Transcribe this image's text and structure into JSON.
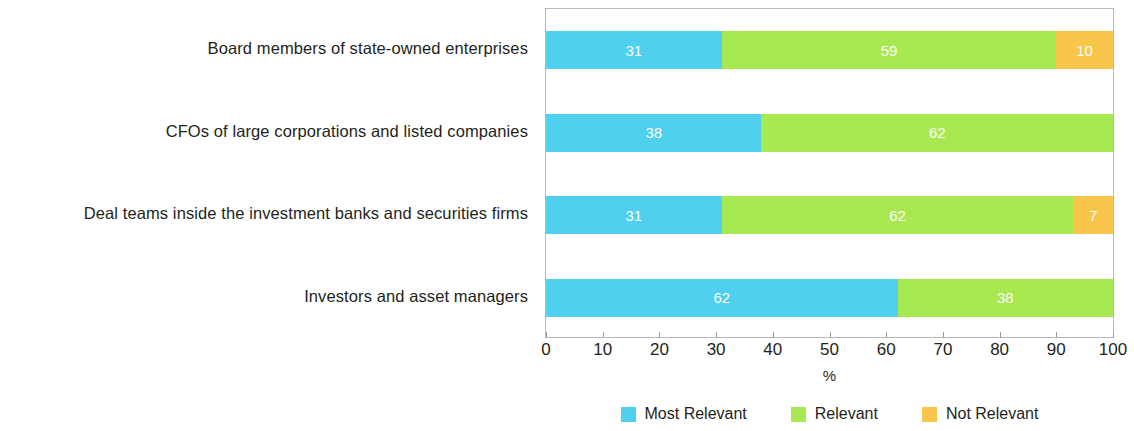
{
  "chart_data": {
    "type": "bar",
    "orientation": "horizontal",
    "stacked": true,
    "stack_mode": "percent",
    "title": "",
    "subtitle": "",
    "xlabel": "%",
    "ylabel": "",
    "xlim": [
      0,
      100
    ],
    "xticks": [
      0,
      10,
      20,
      30,
      40,
      50,
      60,
      70,
      80,
      90,
      100
    ],
    "xtick_labels": [
      "0",
      "10",
      "20",
      "30",
      "40",
      "50",
      "60",
      "70",
      "80",
      "90",
      "100"
    ],
    "grid": false,
    "legend_position": "bottom-center",
    "categories": [
      "Board members of state-owned enterprises",
      "CFOs of large corporations and listed companies",
      "Deal teams inside the investment banks and securities firms",
      "Investors and asset managers"
    ],
    "series": [
      {
        "name": "Most Relevant",
        "color": "#4FD0EE",
        "values": [
          31,
          38,
          31,
          62
        ]
      },
      {
        "name": "Relevant",
        "color": "#A8E851",
        "values": [
          59,
          62,
          62,
          38
        ]
      },
      {
        "name": "Not Relevant",
        "color": "#F8C64A",
        "values": [
          10,
          0,
          7,
          0
        ]
      }
    ],
    "bar_labels": [
      [
        "31",
        "59",
        "10"
      ],
      [
        "38",
        "62",
        ""
      ],
      [
        "31",
        "62",
        "7"
      ],
      [
        "62",
        "38",
        ""
      ]
    ]
  },
  "axis": {
    "x_title": "%",
    "tick_labels": [
      "0",
      "10",
      "20",
      "30",
      "40",
      "50",
      "60",
      "70",
      "80",
      "90",
      "100"
    ]
  },
  "legend": {
    "items": [
      {
        "label": "Most Relevant",
        "color": "#4FD0EE"
      },
      {
        "label": "Relevant",
        "color": "#A8E851"
      },
      {
        "label": "Not Relevant",
        "color": "#F8C64A"
      }
    ]
  },
  "categories": [
    "Board members of state-owned enterprises",
    "CFOs of large corporations and listed companies",
    "Deal teams inside the investment banks and securities firms",
    "Investors and asset managers"
  ],
  "colors": {
    "most_relevant": "#4FD0EE",
    "relevant": "#A8E851",
    "not_relevant": "#F8C64A",
    "axis_line": "#b9b9b9",
    "text": "#231f20"
  }
}
